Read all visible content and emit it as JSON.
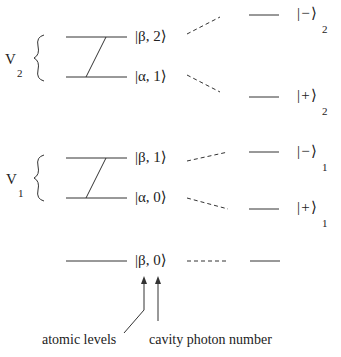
{
  "groups": [
    {
      "name": "V",
      "subscript": "2"
    },
    {
      "name": "V",
      "subscript": "1"
    }
  ],
  "bare_states": [
    {
      "label": "|β, 2⟩",
      "atom": "β",
      "photon": "2"
    },
    {
      "label": "|α, 1⟩",
      "atom": "α",
      "photon": "1"
    },
    {
      "label": "|β, 1⟩",
      "atom": "β",
      "photon": "1"
    },
    {
      "label": "|α, 0⟩",
      "atom": "α",
      "photon": "0"
    },
    {
      "label": "|β, 0⟩",
      "atom": "β",
      "photon": "0"
    }
  ],
  "dressed_states": [
    {
      "sign": "−",
      "subscript": "2"
    },
    {
      "sign": "+",
      "subscript": "2"
    },
    {
      "sign": "−",
      "subscript": "1"
    },
    {
      "sign": "+",
      "subscript": "1"
    }
  ],
  "annotations": {
    "atomic": "atomic levels",
    "photon": "cavity photon number"
  }
}
